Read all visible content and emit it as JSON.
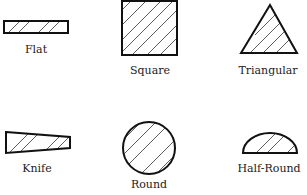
{
  "colors": {
    "stroke": "#111111",
    "hatch": "#333333",
    "text": "#222222",
    "background": "#ffffff"
  },
  "shapes": [
    {
      "id": "flat",
      "label": "Flat",
      "shape": "rectangle",
      "hatched": true
    },
    {
      "id": "square",
      "label": "Square",
      "shape": "square",
      "hatched": true
    },
    {
      "id": "triangular",
      "label": "Triangular",
      "shape": "triangle",
      "hatched": true
    },
    {
      "id": "knife",
      "label": "Knife",
      "shape": "tapered-wedge",
      "hatched": true
    },
    {
      "id": "round",
      "label": "Round",
      "shape": "circle",
      "hatched": true
    },
    {
      "id": "half-round",
      "label": "Half-Round",
      "shape": "semicircle",
      "hatched": true
    }
  ]
}
